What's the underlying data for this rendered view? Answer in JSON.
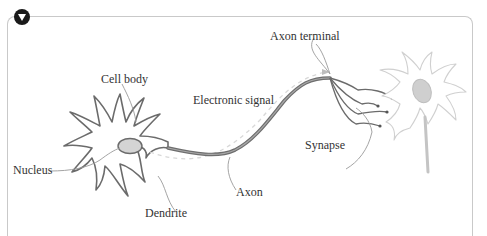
{
  "figure": {
    "collapse_toggle": "collapse",
    "labels": {
      "cell_body": "Cell body",
      "nucleus": "Nucleus",
      "dendrite": "Dendrite",
      "electronic_signal": "Electronic signal",
      "axon": "Axon",
      "axon_terminal": "Axon terminal",
      "synapse": "Synapse"
    },
    "colors": {
      "stroke": "#6b6b6b",
      "axon": "#7a7a7a",
      "nucleus_fill": "#cfcfcf",
      "faded": "#c8c8c8",
      "frame": "#c9c9c9"
    }
  }
}
